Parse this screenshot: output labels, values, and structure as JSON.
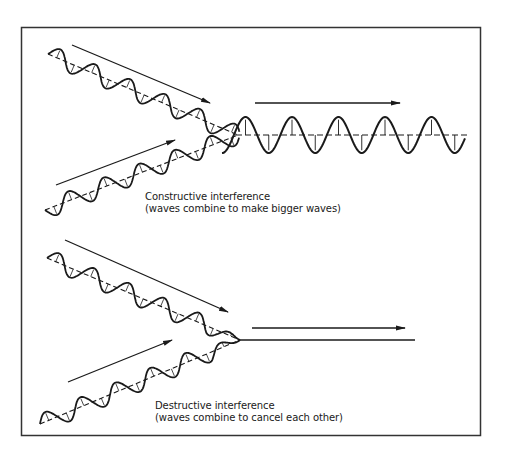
{
  "panels": [
    {
      "id": "constructive",
      "title": "Constructive interference",
      "subtitle": "(waves combine to make bigger waves)",
      "result": "combined wave with larger amplitude"
    },
    {
      "id": "destructive",
      "title": "Destructive interference",
      "subtitle": "(waves combine to cancel each other)",
      "result": "flat line (waves cancel)"
    }
  ],
  "colors": {
    "ink": "#1a1a1a",
    "background": "#ffffff",
    "frame": "#333333"
  }
}
